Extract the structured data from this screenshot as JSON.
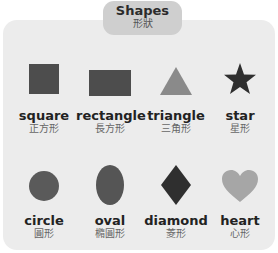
{
  "header": {
    "title": "Shapes",
    "subtitle": "形狀"
  },
  "colors": {
    "panel_bg": "#ececec",
    "tab_bg": "#cfcfcf",
    "square": "#4d4d4d",
    "rectangle": "#4d4d4d",
    "triangle": "#8a8a8a",
    "star": "#2f2f2f",
    "circle": "#5a5a5a",
    "oval": "#555555",
    "diamond": "#2f2f2f",
    "heart": "#a6a6a6"
  },
  "shapes": [
    {
      "id": "square",
      "en": "square",
      "zh": "正方形"
    },
    {
      "id": "rectangle",
      "en": "rectangle",
      "zh": "長方形"
    },
    {
      "id": "triangle",
      "en": "triangle",
      "zh": "三角形"
    },
    {
      "id": "star",
      "en": "star",
      "zh": "星形"
    },
    {
      "id": "circle",
      "en": "circle",
      "zh": "圓形"
    },
    {
      "id": "oval",
      "en": "oval",
      "zh": "橢圓形"
    },
    {
      "id": "diamond",
      "en": "diamond",
      "zh": "菱形"
    },
    {
      "id": "heart",
      "en": "heart",
      "zh": "心形"
    }
  ]
}
